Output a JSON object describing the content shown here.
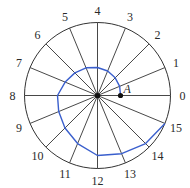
{
  "diagram": {
    "center": [
      97.5,
      95.5
    ],
    "radius": 73,
    "spoke_count": 16,
    "spoke_labels": [
      "0",
      "1",
      "2",
      "3",
      "4",
      "5",
      "6",
      "7",
      "8",
      "9",
      "10",
      "11",
      "12",
      "13",
      "14",
      "15"
    ],
    "label_radius": 85,
    "point_label": "A",
    "spiral_radii": [
      23,
      24,
      25,
      26.5,
      28,
      30,
      32,
      35,
      40,
      42,
      46,
      52,
      60,
      63,
      68,
      73
    ],
    "colors": {
      "circle": "#333333",
      "spokes": "#333333",
      "spiral": "#3a5fcd",
      "point": "#111111",
      "label": "#2a2a2a"
    }
  }
}
